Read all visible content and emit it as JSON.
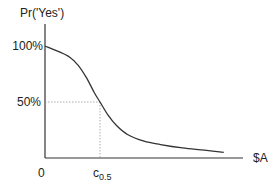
{
  "chart_data": {
    "type": "line",
    "title": "",
    "ylabel": "Pr('Yes')",
    "xlabel": "$A",
    "origin_label": "0",
    "y_ticks": [
      {
        "value": 1.0,
        "label": "100%"
      },
      {
        "value": 0.5,
        "label": "50%"
      }
    ],
    "x_annotation": {
      "label_main": "c",
      "label_sub": "0.5",
      "x": 1.0
    },
    "ylim": [
      0,
      1.0
    ],
    "xlim": [
      0,
      3.5
    ],
    "grid": false,
    "reference_lines": [
      {
        "kind": "horizontal",
        "y": 0.5,
        "x_to": 1.0,
        "style": "dotted"
      },
      {
        "kind": "vertical",
        "x": 1.0,
        "y_to": 0.5,
        "style": "dotted"
      }
    ],
    "series": [
      {
        "name": "Pr('Yes') vs $A",
        "x": [
          0,
          0.25,
          0.45,
          0.6,
          0.75,
          0.9,
          1.0,
          1.15,
          1.3,
          1.5,
          1.8,
          2.1,
          2.5,
          2.9,
          3.25
        ],
        "y": [
          1.0,
          0.95,
          0.9,
          0.83,
          0.72,
          0.58,
          0.5,
          0.38,
          0.29,
          0.21,
          0.15,
          0.12,
          0.09,
          0.07,
          0.05
        ]
      }
    ]
  }
}
